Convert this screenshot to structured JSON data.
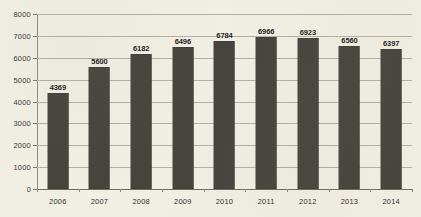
{
  "chart_data": {
    "type": "bar",
    "title": "",
    "subtitle": "",
    "xlabel": "",
    "ylabel": "",
    "categories": [
      "2006",
      "2007",
      "2008",
      "2009",
      "2010",
      "2011",
      "2012",
      "2013",
      "2014"
    ],
    "values": [
      4369,
      5600,
      6182,
      6496,
      6784,
      6966,
      6923,
      6560,
      6397
    ],
    "data_labels": [
      "4369",
      "5600",
      "6182",
      "6496",
      "6784",
      "6966",
      "6923",
      "6560",
      "6397"
    ],
    "ylim": [
      0,
      8000
    ],
    "ytick_values": [
      0,
      1000,
      2000,
      3000,
      4000,
      5000,
      6000,
      7000,
      8000
    ],
    "ytick_labels": [
      "0",
      "1000",
      "2000",
      "3000",
      "4000",
      "5000",
      "6000",
      "7000",
      "8000"
    ],
    "grid": true,
    "grid_axis": "y",
    "legend": false,
    "legend_position": "none",
    "series": [
      {
        "name": "",
        "values": [
          4369,
          5600,
          6182,
          6496,
          6784,
          6966,
          6923,
          6560,
          6397
        ]
      }
    ],
    "colors": {
      "bar_fill": "#474440",
      "background": "#f1eee4",
      "gridline": "#b3b0a2",
      "axis": "#6e6b60",
      "label_text": "#23211d",
      "tick_text": "#34322d"
    }
  }
}
